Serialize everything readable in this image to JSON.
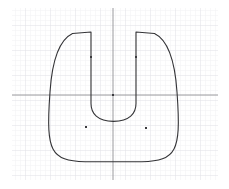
{
  "viewport": {
    "name": "sketch-viewport",
    "width": 229,
    "height": 189,
    "background_color": "#ffffff",
    "description": "2D CAD sketch of a closed U-shaped (horseshoe / slotted tab) profile on a faint graph grid with origin axes"
  },
  "grid": {
    "visible": true,
    "minor_color": "#f2f2f4",
    "major_color": "#e6e6ea",
    "minor_spacing": 5,
    "major_spacing": 25,
    "left": 12,
    "top": 8,
    "right": 218,
    "bottom": 180
  },
  "axes": {
    "visible": true,
    "color": "#9a9a9e",
    "origin_x": 113,
    "origin_y": 95,
    "x_axis_label": "",
    "y_axis_label": "",
    "x_axis_start": 12,
    "x_axis_end": 218,
    "y_axis_start": 8,
    "y_axis_end": 180
  },
  "geometry": {
    "name": "u-shape-profile",
    "stroke_color": "#333336",
    "fill": "none",
    "stroke_width": 1.1,
    "path": "M 91 32 L 72.5 33.5 C 59 40 52 62 50 92 C 47.5 126 48.5 140 53 149 C 58 158.5 68 161.5 85 161.8 L 142 161.8 C 159 161.5 169 158.5 174 149 C 178.5 140 179.5 126 177 92 C 175 62 168 40 154.5 33.5 L 136 32 L 136 103.5 C 136 113.5 129.5 121.2 113.5 121.4 C 97.5 121.2 91 113.5 91 103.5 Z",
    "segments": [
      {
        "name": "left-prong-top-edge",
        "type": "line",
        "from": [
          91,
          32
        ],
        "to": [
          72.5,
          33.5
        ]
      },
      {
        "name": "left-outer-flank",
        "type": "bezier",
        "from": [
          72.5,
          33.5
        ],
        "to": [
          50,
          92
        ]
      },
      {
        "name": "left-outer-lower",
        "type": "bezier",
        "from": [
          50,
          92
        ],
        "to": [
          53,
          149
        ]
      },
      {
        "name": "bottom-left-corner",
        "type": "bezier",
        "from": [
          53,
          149
        ],
        "to": [
          85,
          161.8
        ]
      },
      {
        "name": "bottom-edge",
        "type": "line",
        "from": [
          85,
          161.8
        ],
        "to": [
          142,
          161.8
        ]
      },
      {
        "name": "bottom-right-corner",
        "type": "bezier",
        "from": [
          142,
          161.8
        ],
        "to": [
          174,
          149
        ]
      },
      {
        "name": "right-outer-lower",
        "type": "bezier",
        "from": [
          174,
          149
        ],
        "to": [
          177,
          92
        ]
      },
      {
        "name": "right-outer-flank",
        "type": "bezier",
        "from": [
          177,
          92
        ],
        "to": [
          154.5,
          33.5
        ]
      },
      {
        "name": "right-prong-top-edge",
        "type": "line",
        "from": [
          154.5,
          33.5
        ],
        "to": [
          136,
          32
        ]
      },
      {
        "name": "right-prong-inner-edge",
        "type": "line",
        "from": [
          136,
          32
        ],
        "to": [
          136,
          103.5
        ]
      },
      {
        "name": "notch-arc",
        "type": "arc",
        "from": [
          136,
          103.5
        ],
        "to": [
          91,
          103.5
        ],
        "center": [
          113.5,
          103.5
        ],
        "radius": 22.5
      },
      {
        "name": "left-prong-inner-edge",
        "type": "line",
        "from": [
          91,
          103.5
        ],
        "to": [
          91,
          32
        ]
      }
    ]
  },
  "points": [
    {
      "name": "origin-point",
      "x": 113,
      "y": 95,
      "color": "#3a3a3e",
      "size": 2
    },
    {
      "name": "left-prong-point",
      "x": 91,
      "y": 57,
      "color": "#3a3a3e",
      "size": 2
    },
    {
      "name": "right-prong-point",
      "x": 136,
      "y": 57,
      "color": "#3a3a3e",
      "size": 2
    },
    {
      "name": "lower-left-point",
      "x": 86,
      "y": 127,
      "color": "#3a3a3e",
      "size": 2
    },
    {
      "name": "lower-right-point",
      "x": 146,
      "y": 128,
      "color": "#3a3a3e",
      "size": 2
    }
  ],
  "chart_data": {
    "type": "scatter",
    "title": "",
    "xlabel": "",
    "ylabel": "",
    "grid": true,
    "legend": "none",
    "xlim": [
      -20.2,
      21
    ],
    "ylim": [
      -17,
      17.4
    ],
    "note": "Axis units of 5 screen px = 1 unit; origin at screen (113, 95)",
    "series": [
      {
        "name": "construction-points",
        "x": [
          0,
          -4.4,
          4.6,
          -5.4,
          6.6
        ],
        "y": [
          0,
          7.6,
          7.6,
          -6.4,
          -6.6
        ]
      }
    ],
    "annotations": [
      {
        "name": "profile-outline",
        "type": "closed-path",
        "label": "U-shaped slotted profile"
      }
    ]
  }
}
